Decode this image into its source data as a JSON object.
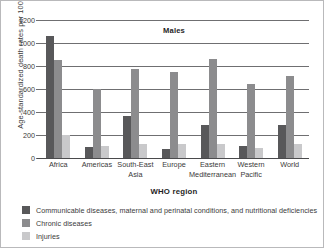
{
  "chart_data": {
    "type": "bar",
    "title": "Males",
    "xlabel": "WHO region",
    "ylabel": "Age-standardized death rates per 100 000",
    "categories": [
      "Africa",
      "Americas",
      "South-East\nAsia",
      "Europe",
      "Eastern\nMediterranean",
      "Western\nPacific",
      "World"
    ],
    "series": [
      {
        "name": "Communicable diseases, maternal and perinatal conditions, and nutritional deficiencies",
        "color": "#58585a",
        "values": [
          1060,
          100,
          365,
          75,
          285,
          105,
          285
        ]
      },
      {
        "name": "Chronic diseases",
        "color": "#8c8c8e",
        "values": [
          855,
          600,
          770,
          745,
          860,
          645,
          710
        ]
      },
      {
        "name": "Injuries",
        "color": "#c9c9cb",
        "values": [
          200,
          105,
          120,
          120,
          120,
          90,
          120
        ]
      }
    ],
    "ylim": [
      0,
      1200
    ],
    "yticks": [
      0,
      200,
      400,
      600,
      800,
      1000,
      1200
    ],
    "ytick_labels": [
      "0",
      "200",
      "400",
      "600",
      "800",
      "1000",
      "1200"
    ],
    "grid": true,
    "legend_position": "below"
  }
}
